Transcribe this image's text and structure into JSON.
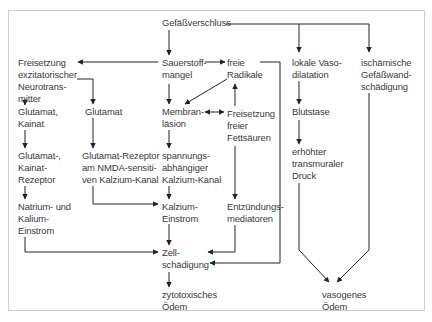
{
  "diagram": {
    "type": "flowchart",
    "topic": "Pathophysiologie des Hirnödems nach Gefäßverschluss",
    "colors": {
      "text": "#3a3a3a",
      "lines": "#222222",
      "frame": "#cfcfcf",
      "background": "#ffffff"
    },
    "nodes": {
      "gefaessverschluss": {
        "lines": [
          "Gefäßverschluss"
        ]
      },
      "sauerstoffmangel": {
        "lines": [
          "Sauerstoff-",
          "mangel"
        ]
      },
      "freie_radikale": {
        "lines": [
          "freie",
          "Radikale"
        ]
      },
      "lokale_vasodilatation": {
        "lines": [
          "lokale Vaso-",
          "dilatation"
        ]
      },
      "ischaemische_gefaesswandschaedigung": {
        "lines": [
          "ischämische",
          "Gefäßwand-",
          "schädigung"
        ]
      },
      "freisetzung_neurotransmitter": {
        "lines": [
          "Freisetzung",
          "exzitatorischer",
          "Neurotrans-",
          "mitter"
        ]
      },
      "glutamat_kainat": {
        "lines": [
          "Glutamat,",
          "Kainat"
        ]
      },
      "glutamat": {
        "lines": [
          "Glutamat"
        ]
      },
      "membranlaesion": {
        "lines": [
          "Membran-",
          "läsion"
        ]
      },
      "freisetzung_fettsaeuren": {
        "lines": [
          "Freisetzung",
          "freier",
          "Fettsäuren"
        ]
      },
      "blutstase": {
        "lines": [
          "Blutstase"
        ]
      },
      "glutamat_kainat_rezeptor": {
        "lines": [
          "Glutamat-,",
          "Kainat-",
          "Rezeptor"
        ]
      },
      "nmda_rezeptor": {
        "lines": [
          "Glutamat-Rezeptor",
          "am NMDA-sensiti-",
          "ven Kalzium-Kanal"
        ]
      },
      "spannungsabh_kanal": {
        "lines": [
          "spannungs-",
          "abhängiger",
          "Kalzium-Kanal"
        ]
      },
      "erhoehter_druck": {
        "lines": [
          "erhöhter",
          "transmuraler",
          "Druck"
        ]
      },
      "natrium_kalium_einstrom": {
        "lines": [
          "Natrium- und",
          "Kalium-",
          "Einstrom"
        ]
      },
      "kalzium_einstrom": {
        "lines": [
          "Kalzium-",
          "Einstrom"
        ]
      },
      "entzuendungsmediatoren": {
        "lines": [
          "Entzündungs-",
          "mediatoren"
        ]
      },
      "zellschaedigung": {
        "lines": [
          "Zell-",
          "schädigung"
        ]
      },
      "zytotoxisches_oedem": {
        "lines": [
          "zytotoxisches",
          "Ödem"
        ]
      },
      "vasogenes_oedem": {
        "lines": [
          "vasogenes",
          "Ödem"
        ]
      }
    },
    "edges": [
      {
        "from": "gefaessverschluss",
        "to": "sauerstoffmangel"
      },
      {
        "from": "gefaessverschluss",
        "to": "lokale_vasodilatation"
      },
      {
        "from": "gefaessverschluss",
        "to": "ischaemische_gefaesswandschaedigung"
      },
      {
        "from": "sauerstoffmangel",
        "to": "freisetzung_neurotransmitter"
      },
      {
        "from": "sauerstoffmangel",
        "to": "freie_radikale"
      },
      {
        "from": "sauerstoffmangel",
        "to": "membranlaesion"
      },
      {
        "from": "freie_radikale",
        "to": "membranlaesion"
      },
      {
        "from": "freie_radikale",
        "to": "zellschaedigung"
      },
      {
        "from": "freisetzung_fettsaeuren",
        "to": "freie_radikale"
      },
      {
        "from": "membranlaesion",
        "to": "freisetzung_fettsaeuren",
        "bidirectional": true
      },
      {
        "from": "freisetzung_neurotransmitter",
        "to": "glutamat_kainat"
      },
      {
        "from": "freisetzung_neurotransmitter",
        "to": "glutamat"
      },
      {
        "from": "glutamat_kainat",
        "to": "glutamat_kainat_rezeptor"
      },
      {
        "from": "glutamat_kainat_rezeptor",
        "to": "natrium_kalium_einstrom"
      },
      {
        "from": "glutamat",
        "to": "nmda_rezeptor"
      },
      {
        "from": "nmda_rezeptor",
        "to": "kalzium_einstrom"
      },
      {
        "from": "membranlaesion",
        "to": "spannungsabh_kanal"
      },
      {
        "from": "spannungsabh_kanal",
        "to": "kalzium_einstrom"
      },
      {
        "from": "kalzium_einstrom",
        "to": "zellschaedigung"
      },
      {
        "from": "natrium_kalium_einstrom",
        "to": "zellschaedigung"
      },
      {
        "from": "freisetzung_fettsaeuren",
        "to": "entzuendungsmediatoren"
      },
      {
        "from": "entzuendungsmediatoren",
        "to": "zellschaedigung"
      },
      {
        "from": "zellschaedigung",
        "to": "zytotoxisches_oedem"
      },
      {
        "from": "lokale_vasodilatation",
        "to": "blutstase"
      },
      {
        "from": "blutstase",
        "to": "erhoehter_druck"
      },
      {
        "from": "erhoehter_druck",
        "to": "vasogenes_oedem"
      },
      {
        "from": "ischaemische_gefaesswandschaedigung",
        "to": "vasogenes_oedem"
      }
    ]
  }
}
